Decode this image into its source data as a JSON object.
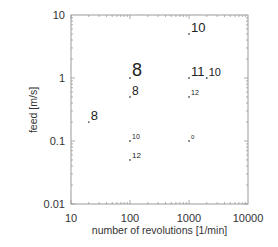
{
  "chart_data": {
    "type": "scatter",
    "title": "",
    "xlabel": "number of revolutions [1/min]",
    "ylabel": "feed [m/s]",
    "xscale": "log",
    "yscale": "log",
    "xlim": [
      10,
      10000
    ],
    "ylim": [
      0.01,
      10
    ],
    "xticks": [
      "10",
      "100",
      "1000",
      "10000"
    ],
    "yticks": [
      "10",
      "1",
      "0.1",
      "0.01"
    ],
    "grid": false,
    "legend": null,
    "points": [
      {
        "x": 20,
        "y": 0.2,
        "label": "8",
        "size": 13
      },
      {
        "x": 100,
        "y": 1,
        "label": "8",
        "size": 18
      },
      {
        "x": 100,
        "y": 0.5,
        "label": "8",
        "size": 12
      },
      {
        "x": 100,
        "y": 0.1,
        "label": "10",
        "size": 7
      },
      {
        "x": 100,
        "y": 0.05,
        "label": "12",
        "size": 8
      },
      {
        "x": 1000,
        "y": 5,
        "label": "10",
        "size": 13
      },
      {
        "x": 1000,
        "y": 1,
        "label": "11",
        "size": 13
      },
      {
        "x": 2000,
        "y": 1,
        "label": "10",
        "size": 11
      },
      {
        "x": 1000,
        "y": 0.5,
        "label": "12",
        "size": 7
      },
      {
        "x": 1000,
        "y": 0.1,
        "label": "0",
        "size": 6
      }
    ]
  },
  "colors": {
    "axis": "#9a9a9a",
    "text": "#222222",
    "marker": "#555555"
  }
}
